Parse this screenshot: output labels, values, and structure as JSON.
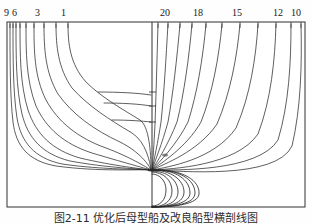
{
  "figure": {
    "title_visible": false,
    "caption": "图2-11  优化后母型船及改良船型横剖线图",
    "background_color": "#fefefe",
    "line_color": "#2a2a2a",
    "frame_color": "#303030"
  },
  "chart_data": {
    "type": "line",
    "title": "",
    "subtitle": "",
    "xlabel": "",
    "ylabel": "",
    "grid": false,
    "legend_position": "none",
    "xlim": [
      0,
      312
    ],
    "ylim": [
      224,
      0
    ],
    "frame": {
      "left": 7,
      "right": 305,
      "top": 22,
      "bottom": 207
    },
    "centerline_x": 152,
    "baseline_y": 170,
    "left_labels": [
      {
        "text": "9",
        "x": 6,
        "y": 12
      },
      {
        "text": "6",
        "x": 14,
        "y": 12
      },
      {
        "text": "3",
        "x": 38,
        "y": 12
      },
      {
        "text": "1",
        "x": 63,
        "y": 12
      }
    ],
    "right_labels": [
      {
        "text": "20",
        "x": 163,
        "y": 12
      },
      {
        "text": "18",
        "x": 196,
        "y": 12
      },
      {
        "text": "15",
        "x": 234,
        "y": 12
      },
      {
        "text": "12",
        "x": 276,
        "y": 12
      },
      {
        "text": "10",
        "x": 293,
        "y": 12
      }
    ],
    "left_station_labels": [
      "9",
      "6",
      "3",
      "1"
    ],
    "right_station_labels": [
      "20",
      "18",
      "15",
      "12",
      "10"
    ],
    "series": [
      {
        "name": "aft-station-9",
        "side": "aft",
        "path": "M 10,24 C 10,60 10,96 13,122 C 16,146 28,161 56,166 C 100,172 140,169 151,170"
      },
      {
        "name": "aft-station-8",
        "side": "aft",
        "path": "M 13,24 C 13,58 13,92 17,118 C 21,142 34,158 62,164 C 104,170 141,169 151,170"
      },
      {
        "name": "aft-station-7",
        "side": "aft",
        "path": "M 16,24 C 16,56 16,88 22,114 C 28,138 42,154 70,161 C 108,168 142,169 151,170"
      },
      {
        "name": "aft-station-6",
        "side": "aft",
        "path": "M 20,24 C 20,54 20,84 28,110 C 36,134 52,150 80,158 C 114,166 143,169 151,170"
      },
      {
        "name": "aft-station-5",
        "side": "aft",
        "path": "M 26,24 C 26,52 26,80 36,106 C 46,128 64,144 92,153 C 122,162 144,168 151,170"
      },
      {
        "name": "aft-station-4",
        "side": "aft",
        "path": "M 34,24 C 34,50 34,76 46,100 C 58,122 78,138 106,148 C 130,157 146,167 151,170"
      },
      {
        "name": "aft-station-3",
        "side": "aft",
        "path": "M 44,24 C 44,48 45,72 58,94 C 72,114 94,130 120,142 C 140,152 149,165 151,170"
      },
      {
        "name": "aft-station-2",
        "side": "aft",
        "path": "M 56,24 C 56,46 58,68 72,88 C 88,106 110,120 132,133 C 146,142 150,162 151,170"
      },
      {
        "name": "aft-station-1",
        "side": "aft",
        "path": "M 68,24 C 68,44 70,64 86,82 C 102,98 124,110 140,120 C 149,126 151,152 151,170"
      },
      {
        "name": "aft-waterline-upper",
        "side": "aft",
        "path": "M 98,92 C 118,92 138,93 151,95"
      },
      {
        "name": "aft-waterline-mid",
        "side": "aft",
        "path": "M 104,103 C 122,103 140,104 151,106"
      },
      {
        "name": "aft-waterline-low",
        "side": "aft",
        "path": "M 112,120 C 128,120 142,121 151,122"
      },
      {
        "name": "fwd-station-20",
        "side": "fwd",
        "path": "M 158,24 C 157,60 156,96 155,124 C 154,144 153,160 152,170"
      },
      {
        "name": "fwd-station-19",
        "side": "fwd",
        "path": "M 168,24 C 166,58 164,94 161,122 C 158,142 154,160 152,170"
      },
      {
        "name": "fwd-station-18",
        "side": "fwd",
        "path": "M 180,24 C 177,58 173,94 168,122 C 162,144 155,161 152,170"
      },
      {
        "name": "fwd-station-17",
        "side": "fwd",
        "path": "M 192,24 C 189,58 184,94 177,122 C 168,145 157,162 152,170"
      },
      {
        "name": "fwd-station-16",
        "side": "fwd",
        "path": "M 206,24 C 203,58 197,94 188,122 C 176,146 159,162 152,170"
      },
      {
        "name": "fwd-station-15",
        "side": "fwd",
        "path": "M 222,24 C 219,58 212,94 201,122 C 186,148 161,163 152,170"
      },
      {
        "name": "fwd-station-14",
        "side": "fwd",
        "path": "M 240,24 C 237,58 230,94 217,124 C 198,152 164,164 152,170"
      },
      {
        "name": "fwd-station-13",
        "side": "fwd",
        "path": "M 258,24 C 256,58 250,96 236,128 C 214,160 168,167 152,170"
      },
      {
        "name": "fwd-station-12",
        "side": "fwd",
        "path": "M 276,24 C 275,60 271,100 258,134 C 236,166 172,169 152,170"
      },
      {
        "name": "fwd-station-11",
        "side": "fwd",
        "path": "M 291,24 C 291,62 289,104 278,140 C 258,172 176,170 152,170"
      },
      {
        "name": "fwd-station-10",
        "side": "fwd",
        "path": "M 301,24 C 302,64 301,108 292,146 C 276,180 180,171 152,170"
      },
      {
        "name": "bulb-contour-1",
        "side": "bulb",
        "path": "M 152,174 C 160,174 166,181 166,190 C 166,200 160,206 152,206"
      },
      {
        "name": "bulb-contour-2",
        "side": "bulb",
        "path": "M 152,172 C 163,172 172,180 172,191 C 172,201 164,207 152,207"
      },
      {
        "name": "bulb-contour-3",
        "side": "bulb",
        "path": "M 152,171 C 167,171 178,180 178,192 C 178,202 167,207 152,207"
      },
      {
        "name": "bulb-contour-4",
        "side": "bulb",
        "path": "M 152,170 C 171,170 184,180 184,192 C 184,203 170,207 152,207"
      },
      {
        "name": "bulb-contour-5",
        "side": "bulb",
        "path": "M 152,170 C 176,169 190,180 190,193 C 190,203 172,207 152,207"
      },
      {
        "name": "bulb-contour-6",
        "side": "bulb",
        "path": "M 152,170 C 180,169 195,180 195,193 C 195,204 174,207 152,207"
      },
      {
        "name": "bulb-contour-7",
        "side": "bulb",
        "path": "M 152,170 C 184,169 200,181 199,194 C 198,204 176,207 152,207"
      }
    ],
    "tick_count_left": 10,
    "tick_count_right": 12
  }
}
